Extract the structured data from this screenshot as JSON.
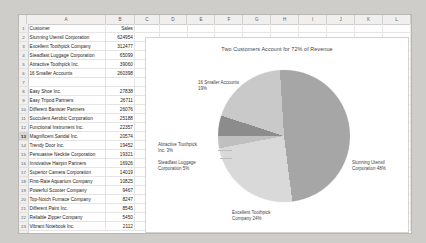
{
  "spreadsheet": {
    "column_headers": [
      "A",
      "B",
      "C",
      "D",
      "E",
      "F",
      "G",
      "H",
      "I",
      "J",
      "K",
      "L"
    ],
    "selected_row": 13,
    "headers": {
      "customer": "Customer",
      "sales": "Sales"
    },
    "rows": [
      {
        "n": 1,
        "customer": "Customer",
        "sales": "Sales"
      },
      {
        "n": 2,
        "customer": "Stunning Utensil Corporation",
        "sales": "624954"
      },
      {
        "n": 3,
        "customer": "Excellent Toothpick Company",
        "sales": "312477"
      },
      {
        "n": 4,
        "customer": "Steadfast Luggage Corporation",
        "sales": "65099"
      },
      {
        "n": 5,
        "customer": "Attractive Toothpick Inc.",
        "sales": "39060"
      },
      {
        "n": 6,
        "customer": "16 Smaller Accounts",
        "sales": "260398"
      },
      {
        "n": 7,
        "customer": "",
        "sales": ""
      },
      {
        "n": 8,
        "customer": "Easy Shoe Inc.",
        "sales": "27838"
      },
      {
        "n": 9,
        "customer": "Easy Tripod Partners",
        "sales": "26711"
      },
      {
        "n": 10,
        "customer": "Different Banister Partners",
        "sales": "26076"
      },
      {
        "n": 11,
        "customer": "Succulent Aerobic Corporation",
        "sales": "25188"
      },
      {
        "n": 12,
        "customer": "Functional Instrument Inc.",
        "sales": "22357"
      },
      {
        "n": 13,
        "customer": "Magnificent Sandal Inc.",
        "sales": "20574"
      },
      {
        "n": 14,
        "customer": "Trendy Door Inc.",
        "sales": "19452"
      },
      {
        "n": 15,
        "customer": "Persuasive Necktie Corporation",
        "sales": "19321"
      },
      {
        "n": 16,
        "customer": "Innovative Hairpin Partners",
        "sales": "16926"
      },
      {
        "n": 17,
        "customer": "Superior Camera Corporation",
        "sales": "14019"
      },
      {
        "n": 18,
        "customer": "First-Rate Aquarium Company",
        "sales": "10825"
      },
      {
        "n": 19,
        "customer": "Powerful Scooter Company",
        "sales": "9467"
      },
      {
        "n": 20,
        "customer": "Top-Notch Furnace Company",
        "sales": "8247"
      },
      {
        "n": 21,
        "customer": "Different Paint Inc.",
        "sales": "8545"
      },
      {
        "n": 22,
        "customer": "Reliable Zipper Company",
        "sales": "5450"
      },
      {
        "n": 23,
        "customer": "Vibrant Notebook Inc.",
        "sales": "2112"
      }
    ]
  },
  "chart_data": {
    "type": "pie",
    "title": "Two Customers Account for 72% of Revenue",
    "categories": [
      "Stunning Utensil Corporation",
      "Excellent Toothpick Company",
      "Steadfast Luggage Corporation",
      "Attractive Toothpick Inc.",
      "16 Smaller Accounts"
    ],
    "values": [
      624954,
      312477,
      65099,
      39060,
      260398
    ],
    "percentages": [
      48,
      24,
      5,
      3,
      19
    ],
    "labels": [
      "Stunning Utensil Corporation 48%",
      "Excellent Toothpick Company 24%",
      "Steadfast Luggage Corporation 5%",
      "Attractive Toothpick Inc. 3%",
      "16 Smaller Accounts 19%"
    ],
    "label_lines": {
      "stunning_1": "Stunning Utensil",
      "stunning_2": "Corporation 48%",
      "excellent_1": "Excellent Toothpick",
      "excellent_2": "Company 24%",
      "steadfast_1": "Steadfast Luggage",
      "steadfast_2": "Corporation 5%",
      "attractive_1": "Attractive Toothpick",
      "attractive_2": "Inc. 3%",
      "smaller_1": "16 Smaller Accounts",
      "smaller_2": "19%"
    },
    "colors": [
      "#a6a6a6",
      "#d9d9d9",
      "#bfbfbf",
      "#8c8c8c",
      "#c9c9c9"
    ],
    "legend": "none",
    "grid": false
  }
}
